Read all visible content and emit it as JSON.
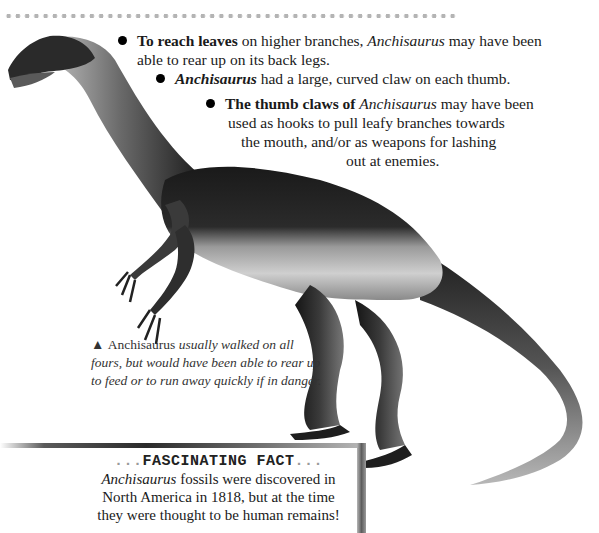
{
  "decoration": {
    "dot_row": "dotted-divider"
  },
  "bullets": [
    {
      "lead": "To reach leaves",
      "text_1": " on higher branches, ",
      "italic": "Anchisaurus",
      "text_2": " may have been",
      "line2": "able to rear up on its back legs."
    },
    {
      "lead": "Anchisaurus",
      "text_1": " had a large, curved claw on each thumb."
    },
    {
      "lead": "The thumb claws of ",
      "italic": "Anchisaurus",
      "text_1": " may have been",
      "line2": "used as hooks to pull leafy branches towards",
      "line3": "the mouth, and/or as weapons for lashing",
      "line4": "out at enemies."
    }
  ],
  "caption": {
    "marker": "▲",
    "name": "Anchisaurus",
    "line1": " usually walked on all",
    "line2": "fours, but would have been able to rear up",
    "line3": "to feed or to run away quickly if in danger."
  },
  "fact_box": {
    "title_prefix": "...",
    "title": "FASCINATING FACT",
    "title_suffix": "...",
    "italic": "Anchisaurus",
    "line1": " fossils were discovered in",
    "line2": "North America in 1818, but at the time",
    "line3": "they were thought to be human remains!"
  },
  "illustration": {
    "subject": "Anchisaurus dinosaur illustration"
  },
  "colors": {
    "text": "#1e1e1e",
    "dots": "#b4b4b4",
    "dino_dark": "#1c1c1c",
    "dino_light": "#bdbdbd"
  }
}
